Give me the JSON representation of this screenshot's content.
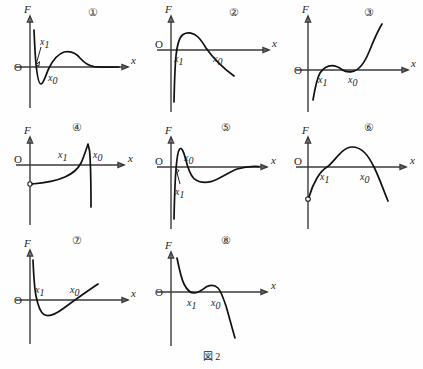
{
  "figure": {
    "caption": "図 2",
    "axis_labels": {
      "vertical": "F",
      "horizontal": "x",
      "origin": "O"
    },
    "point_labels": {
      "x0": "x",
      "x0_sub": "0",
      "x1": "x",
      "x1_sub": "1"
    }
  },
  "panels": [
    {
      "number": "①",
      "description": "Steep negative spike near origin, deep minimum just past x0, rises to a low broad maximum, then decays asymptotically to zero from above.",
      "labels": {
        "x1": "x",
        "x1_sub": "1",
        "x0": "x",
        "x0_sub": "0"
      },
      "x1_position": "above-axis-left-with-arrow",
      "x0_position": "below-axis"
    },
    {
      "number": "②",
      "description": "Rises steeply from far below the axis, crosses at x1, rounded maximum, then long straight descent crossing the axis at x0 and continuing downward.",
      "labels": {
        "x1": "x",
        "x1_sub": "1",
        "x0": "x",
        "x0_sub": "0"
      },
      "x1_position": "below-axis",
      "x0_position": "below-axis"
    },
    {
      "number": "③",
      "description": "Cubic-like curve rising from below the axis, local maximum just above the axis after x1, dips tangentially back to the axis at x0, then rises steeply.",
      "labels": {
        "x1": "x",
        "x1_sub": "1",
        "x0": "x",
        "x0_sub": "0"
      },
      "x1_position": "below-axis",
      "x0_position": "below-axis"
    },
    {
      "number": "④",
      "description": "Begins at an open circle below the axis on the F axis, rises slowly, crosses the axis at x1, sharp peak above the axis, then drops vertically down past x0.",
      "labels": {
        "x1": "x",
        "x1_sub": "1",
        "x0": "x",
        "x0_sub": "0"
      },
      "x1_position": "above-axis",
      "x0_position": "above-axis"
    },
    {
      "number": "⑤",
      "description": "Sharp positive peak immediately right of the F axis, falls through the axis, broad shallow minimum below, then returns asymptotically to zero from below.",
      "labels": {
        "x0": "x",
        "x0_sub": "0",
        "x1": "x",
        "x1_sub": "1"
      },
      "x0_position": "above-axis",
      "x1_position": "below-axis-with-arrow"
    },
    {
      "number": "⑥",
      "description": "Downward opening parabola starting at an open circle below the axis, crossing the axis at x1, peaking, then crossing again at x0 and falling.",
      "labels": {
        "x1": "x",
        "x1_sub": "1",
        "x0": "x",
        "x0_sub": "0"
      },
      "x1_position": "below-axis",
      "x0_position": "below-axis"
    },
    {
      "number": "⑦",
      "description": "Falls steeply from high positive values, crosses the axis at x1, deep minimum below, then rises linearly back through the axis at x0 and continues upward.",
      "labels": {
        "x1": "x",
        "x1_sub": "1",
        "x0": "x",
        "x0_sub": "0"
      },
      "x1_position": "above-axis",
      "x0_position": "above-axis"
    },
    {
      "number": "⑧",
      "description": "Descends steeply from high positive values, crosses the axis at x1, small hump back above the axis, crosses down again at x0, then plunges steeply.",
      "labels": {
        "x1": "x",
        "x1_sub": "1",
        "x0": "x",
        "x0_sub": "0"
      },
      "x1_position": "below-axis",
      "x0_position": "below-axis"
    }
  ]
}
